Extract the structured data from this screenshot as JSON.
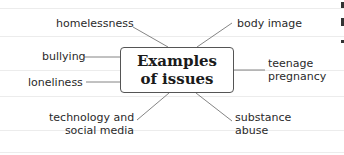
{
  "diagram": {
    "type": "mind-map",
    "central_topic": [
      "Examples",
      "of issues"
    ],
    "branches": [
      {
        "label": [
          "homelessness"
        ],
        "position": "top-left"
      },
      {
        "label": [
          "bullying"
        ],
        "position": "left"
      },
      {
        "label": [
          "loneliness"
        ],
        "position": "left-lower"
      },
      {
        "label": [
          "technology and",
          "social media"
        ],
        "position": "bottom-left"
      },
      {
        "label": [
          "body image"
        ],
        "position": "top-right"
      },
      {
        "label": [
          "teenage",
          "pregnancy"
        ],
        "position": "right"
      },
      {
        "label": [
          "substance",
          "abuse"
        ],
        "position": "bottom-right"
      }
    ]
  },
  "colors": {
    "text": "#2a2a2a",
    "lines": "#555555",
    "rules": "#ececec"
  }
}
